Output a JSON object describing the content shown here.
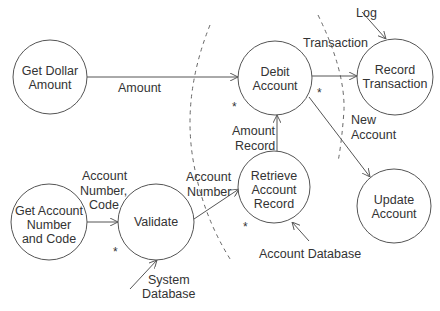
{
  "diagram": {
    "type": "data-flow-diagram",
    "nodes": [
      {
        "id": "get_dollar_amount",
        "lines": [
          "Get Dollar",
          "Amount"
        ],
        "cx": 50,
        "cy": 77,
        "r": 37,
        "starred": false
      },
      {
        "id": "debit_account",
        "lines": [
          "Debit",
          "Account"
        ],
        "cx": 275,
        "cy": 78,
        "r": 37,
        "starred": true
      },
      {
        "id": "record_transaction",
        "lines": [
          "Record",
          "Transaction"
        ],
        "cx": 395,
        "cy": 77,
        "r": 38,
        "starred": false
      },
      {
        "id": "get_account_number_and_code",
        "lines": [
          "Get Account",
          "Number",
          "and Code"
        ],
        "cx": 49,
        "cy": 222,
        "r": 38,
        "starred": false
      },
      {
        "id": "validate",
        "lines": [
          "Validate"
        ],
        "cx": 156,
        "cy": 222,
        "r": 38,
        "starred": true
      },
      {
        "id": "retrieve_account_record",
        "lines": [
          "Retrieve",
          "Account",
          "Record"
        ],
        "cx": 274,
        "cy": 187,
        "r": 36,
        "starred": true
      },
      {
        "id": "update_account",
        "lines": [
          "Update",
          "Account"
        ],
        "cx": 394,
        "cy": 206,
        "r": 37,
        "starred": false
      }
    ],
    "edges": [
      {
        "from": "get_dollar_amount",
        "to": "debit_account",
        "label": "Amount"
      },
      {
        "from": "debit_account",
        "to": "record_transaction",
        "label": "Transaction"
      },
      {
        "from": "external",
        "to": "record_transaction",
        "label": "Log"
      },
      {
        "from": "debit_account",
        "to": "update_account",
        "label": "New Account"
      },
      {
        "from": "retrieve_account_record",
        "to": "debit_account",
        "label": "Amount Record"
      },
      {
        "from": "validate",
        "to": "retrieve_account_record",
        "label": "Account Number"
      },
      {
        "from": "get_account_number_and_code",
        "to": "validate",
        "label": "Account Number, Code"
      },
      {
        "from": "external",
        "to": "validate",
        "label": "System Database"
      },
      {
        "from": "external",
        "to": "retrieve_account_record",
        "label": "Account Database"
      }
    ],
    "labels": {
      "amount": "Amount",
      "transaction": "Transaction",
      "log": "Log",
      "new_account": [
        "New",
        "Account"
      ],
      "amount_record": [
        "Amount",
        "Record"
      ],
      "account_number": [
        "Account",
        "Number"
      ],
      "account_number_code": [
        "Account",
        "Number,",
        "Code"
      ],
      "system_database": [
        "System",
        "Database"
      ],
      "account_database": "Account Database"
    },
    "star_marker": "*",
    "boundaries": [
      "left dashed transaction boundary",
      "right dashed transaction boundary"
    ]
  }
}
